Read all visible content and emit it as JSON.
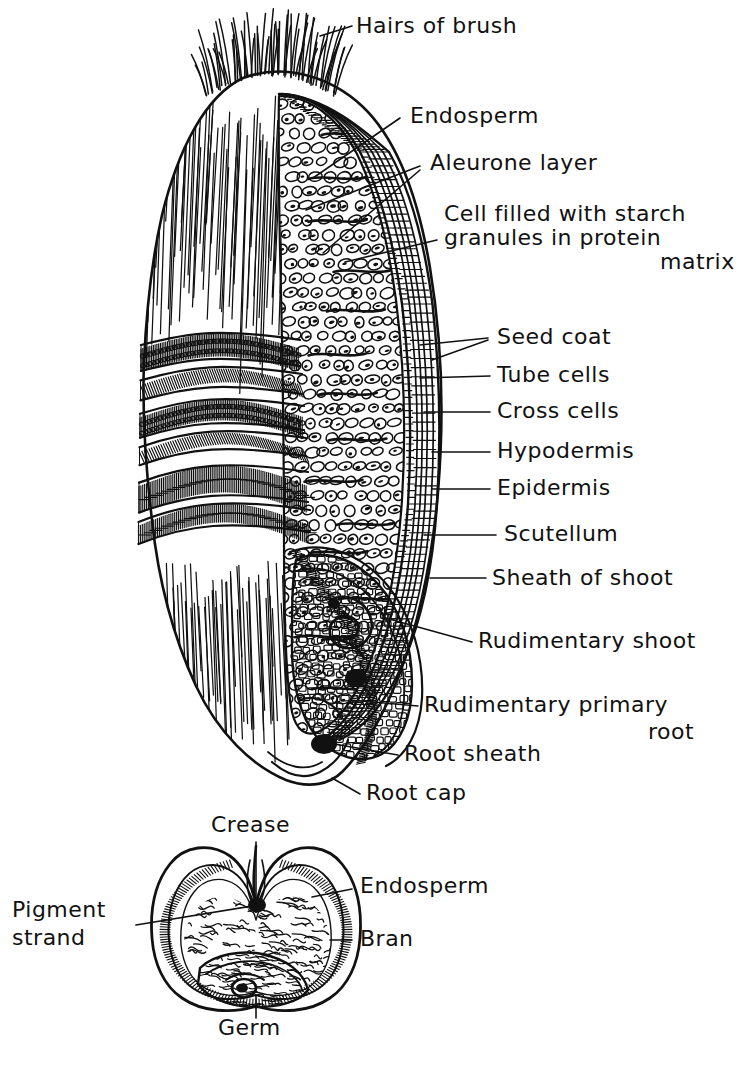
{
  "figure": {
    "title_visible": false,
    "ink_color": "#111111",
    "background_color": "#ffffff"
  },
  "main_diagram": {
    "name": "wheat-kernel-longitudinal-section",
    "labels": [
      {
        "id": "hairs-of-brush",
        "text": "Hairs of brush",
        "x": 356,
        "y": 33,
        "anchor": "start"
      },
      {
        "id": "endosperm",
        "text": "Endosperm",
        "x": 410,
        "y": 123,
        "anchor": "start"
      },
      {
        "id": "aleurone-layer",
        "text": "Aleurone layer",
        "x": 430,
        "y": 170,
        "anchor": "start"
      },
      {
        "id": "cell-starch-line1",
        "text": "Cell filled with starch",
        "x": 444,
        "y": 221,
        "anchor": "start"
      },
      {
        "id": "cell-starch-line2",
        "text": "granules in protein",
        "x": 444,
        "y": 245,
        "anchor": "start"
      },
      {
        "id": "cell-starch-line3",
        "text": "matrix",
        "x": 660,
        "y": 269,
        "anchor": "start"
      },
      {
        "id": "seed-coat",
        "text": "Seed coat",
        "x": 497,
        "y": 344,
        "anchor": "start"
      },
      {
        "id": "tube-cells",
        "text": "Tube cells",
        "x": 497,
        "y": 382,
        "anchor": "start"
      },
      {
        "id": "cross-cells",
        "text": "Cross cells",
        "x": 497,
        "y": 418,
        "anchor": "start"
      },
      {
        "id": "hypodermis",
        "text": "Hypodermis",
        "x": 497,
        "y": 458,
        "anchor": "start"
      },
      {
        "id": "epidermis",
        "text": "Epidermis",
        "x": 497,
        "y": 495,
        "anchor": "start"
      },
      {
        "id": "scutellum",
        "text": "Scutellum",
        "x": 504,
        "y": 541,
        "anchor": "start"
      },
      {
        "id": "sheath-of-shoot",
        "text": "Sheath of shoot",
        "x": 492,
        "y": 585,
        "anchor": "start"
      },
      {
        "id": "rudimentary-shoot",
        "text": "Rudimentary shoot",
        "x": 478,
        "y": 648,
        "anchor": "start"
      },
      {
        "id": "rudimentary-root-l1",
        "text": "Rudimentary primary",
        "x": 424,
        "y": 712,
        "anchor": "start"
      },
      {
        "id": "rudimentary-root-l2",
        "text": "root",
        "x": 648,
        "y": 739,
        "anchor": "start"
      },
      {
        "id": "root-sheath",
        "text": "Root sheath",
        "x": 404,
        "y": 761,
        "anchor": "start"
      },
      {
        "id": "root-cap",
        "text": "Root cap",
        "x": 366,
        "y": 800,
        "anchor": "start"
      }
    ],
    "leaders": [
      {
        "id": "leader-hairs-of-brush",
        "points": "320,36 352,26"
      },
      {
        "id": "leader-endosperm",
        "points": "313,178 400,118"
      },
      {
        "id": "leader-aleurone-a",
        "points": "306,210 420,166"
      },
      {
        "id": "leader-aleurone-b",
        "points": "323,253 420,170"
      },
      {
        "id": "leader-cell-starch",
        "points": "345,262 437,240"
      },
      {
        "id": "leader-seed-coat-a",
        "points": "420,345 488,338"
      },
      {
        "id": "leader-seed-coat-b",
        "points": "432,360 488,340"
      },
      {
        "id": "leader-tube-cells",
        "points": "420,378 490,376"
      },
      {
        "id": "leader-cross-cells",
        "points": "424,412 490,412"
      },
      {
        "id": "leader-hypodermis",
        "points": "432,452 490,452"
      },
      {
        "id": "leader-epidermis",
        "points": "432,489 490,489"
      },
      {
        "id": "leader-scutellum",
        "points": "424,535 496,535"
      },
      {
        "id": "leader-sheath-of-shoot",
        "points": "430,578 486,578"
      },
      {
        "id": "leader-rudimentary-shoot",
        "points": "382,617 472,642"
      },
      {
        "id": "leader-rudimentary-root",
        "points": "350,700 418,706"
      },
      {
        "id": "leader-root-sheath",
        "points": "322,742 398,755"
      },
      {
        "id": "leader-root-cap",
        "points": "332,778 360,794"
      }
    ]
  },
  "cross_section": {
    "name": "wheat-kernel-cross-section",
    "labels": [
      {
        "id": "crease",
        "text": "Crease",
        "x": 211,
        "y": 832,
        "anchor": "start"
      },
      {
        "id": "endosperm-cs",
        "text": "Endosperm",
        "x": 360,
        "y": 893,
        "anchor": "start"
      },
      {
        "id": "pigment-l1",
        "text": "Pigment",
        "x": 12,
        "y": 917,
        "anchor": "start"
      },
      {
        "id": "pigment-l2",
        "text": "strand",
        "x": 12,
        "y": 945,
        "anchor": "start"
      },
      {
        "id": "bran",
        "text": "Bran",
        "x": 360,
        "y": 946,
        "anchor": "start"
      },
      {
        "id": "germ",
        "text": "Germ",
        "x": 218,
        "y": 1035,
        "anchor": "start"
      }
    ],
    "leaders": [
      {
        "id": "leader-crease",
        "points": "256,842 256,903"
      },
      {
        "id": "leader-endosperm-cs",
        "points": "312,897 352,889"
      },
      {
        "id": "leader-pigment",
        "points": "136,925 258,905"
      },
      {
        "id": "leader-bran",
        "points": "330,940 352,940"
      },
      {
        "id": "leader-germ",
        "points": "256,995 256,1018"
      }
    ]
  }
}
